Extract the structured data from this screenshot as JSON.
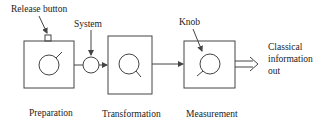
{
  "diagram": {
    "type": "block-flow",
    "labels": {
      "release_button": "Release button",
      "system": "System",
      "knob": "Knob",
      "output_line1": "Classical",
      "output_line2": "information",
      "output_line3": "out"
    },
    "stages": [
      {
        "id": "preparation",
        "label": "Preparation"
      },
      {
        "id": "transformation",
        "label": "Transformation"
      },
      {
        "id": "measurement",
        "label": "Measurement"
      }
    ],
    "colors": {
      "line": "#444444",
      "text": "#222222",
      "background": "#ffffff"
    }
  }
}
